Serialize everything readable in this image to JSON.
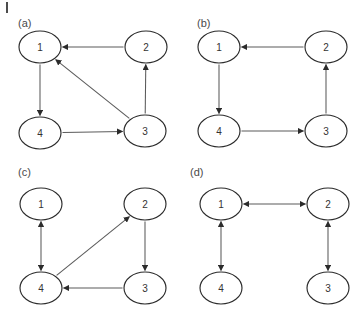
{
  "figure": {
    "corner_tick": "page-edge-mark",
    "node_labels": [
      "1",
      "2",
      "3",
      "4"
    ],
    "panels": [
      {
        "id": "a",
        "label": "(a)",
        "nodes": [
          {
            "id": "1",
            "label": "1",
            "cx": 40,
            "cy": 47,
            "rx": 21,
            "ry": 16
          },
          {
            "id": "2",
            "label": "2",
            "cx": 146,
            "cy": 47,
            "rx": 21,
            "ry": 16
          },
          {
            "id": "3",
            "label": "3",
            "cx": 145,
            "cy": 131,
            "rx": 21,
            "ry": 16
          },
          {
            "id": "4",
            "label": "4",
            "cx": 40,
            "cy": 133,
            "rx": 21,
            "ry": 16
          }
        ],
        "edges": [
          {
            "from": "2",
            "to": "1",
            "type": "directed",
            "shape": "straight"
          },
          {
            "from": "1",
            "to": "4",
            "type": "directed",
            "shape": "straight"
          },
          {
            "from": "4",
            "to": "3",
            "type": "directed",
            "shape": "straight"
          },
          {
            "from": "3",
            "to": "2",
            "type": "directed",
            "shape": "straight"
          },
          {
            "from": "3",
            "to": "1",
            "type": "directed",
            "shape": "diagonal"
          }
        ]
      },
      {
        "id": "b",
        "label": "(b)",
        "nodes": [
          {
            "id": "1",
            "label": "1",
            "cx": 38,
            "cy": 47,
            "rx": 21,
            "ry": 16
          },
          {
            "id": "2",
            "label": "2",
            "cx": 145,
            "cy": 47,
            "rx": 21,
            "ry": 16
          },
          {
            "id": "3",
            "label": "3",
            "cx": 145,
            "cy": 131,
            "rx": 21,
            "ry": 16
          },
          {
            "id": "4",
            "label": "4",
            "cx": 38,
            "cy": 131,
            "rx": 21,
            "ry": 16
          }
        ],
        "edges": [
          {
            "from": "2",
            "to": "1",
            "type": "directed",
            "shape": "straight"
          },
          {
            "from": "1",
            "to": "4",
            "type": "directed",
            "shape": "straight"
          },
          {
            "from": "4",
            "to": "3",
            "type": "directed",
            "shape": "straight"
          },
          {
            "from": "3",
            "to": "2",
            "type": "directed",
            "shape": "straight"
          }
        ]
      },
      {
        "id": "c",
        "label": "(c)",
        "nodes": [
          {
            "id": "1",
            "label": "1",
            "cx": 41,
            "cy": 46,
            "rx": 21,
            "ry": 16
          },
          {
            "id": "2",
            "label": "2",
            "cx": 145,
            "cy": 46,
            "rx": 21,
            "ry": 16
          },
          {
            "id": "3",
            "label": "3",
            "cx": 145,
            "cy": 130,
            "rx": 21,
            "ry": 16
          },
          {
            "id": "4",
            "label": "4",
            "cx": 41,
            "cy": 130,
            "rx": 21,
            "ry": 16
          }
        ],
        "edges": [
          {
            "from": "1",
            "to": "4",
            "type": "bidirectional",
            "shape": "straight"
          },
          {
            "from": "4",
            "to": "2",
            "type": "directed",
            "shape": "diagonal"
          },
          {
            "from": "2",
            "to": "3",
            "type": "directed",
            "shape": "straight"
          },
          {
            "from": "3",
            "to": "4",
            "type": "directed",
            "shape": "straight"
          }
        ]
      },
      {
        "id": "d",
        "label": "(d)",
        "nodes": [
          {
            "id": "1",
            "label": "1",
            "cx": 40,
            "cy": 46,
            "rx": 21,
            "ry": 16
          },
          {
            "id": "2",
            "label": "2",
            "cx": 147,
            "cy": 46,
            "rx": 21,
            "ry": 16
          },
          {
            "id": "3",
            "label": "3",
            "cx": 147,
            "cy": 130,
            "rx": 21,
            "ry": 16
          },
          {
            "id": "4",
            "label": "4",
            "cx": 40,
            "cy": 130,
            "rx": 21,
            "ry": 16
          }
        ],
        "edges": [
          {
            "from": "1",
            "to": "2",
            "type": "bidirectional",
            "shape": "straight"
          },
          {
            "from": "1",
            "to": "4",
            "type": "bidirectional",
            "shape": "straight"
          },
          {
            "from": "2",
            "to": "3",
            "type": "bidirectional",
            "shape": "straight"
          }
        ]
      }
    ],
    "colors": {
      "background": "#ffffff",
      "node_stroke": "#2b2b2b",
      "node_fill": "#ffffff",
      "edge_stroke": "#5a5a5a",
      "text": "#333333",
      "label_text": "#4a4a4a"
    }
  }
}
